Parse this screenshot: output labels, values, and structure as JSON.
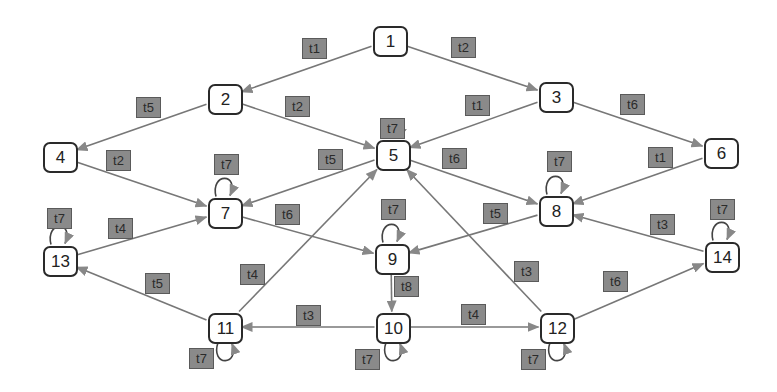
{
  "diagram": {
    "type": "state-transition-graph",
    "colors": {
      "edge": "#777777",
      "arrowhead": "#888888",
      "node_border": "#2a2a2a",
      "label_fill": "#8a8a8a",
      "label_text": "#2b2b2b"
    },
    "nodes": [
      {
        "id": "1",
        "label": "1",
        "x": 389,
        "y": 40
      },
      {
        "id": "2",
        "label": "2",
        "x": 224,
        "y": 98
      },
      {
        "id": "3",
        "label": "3",
        "x": 555,
        "y": 96
      },
      {
        "id": "4",
        "label": "4",
        "x": 59,
        "y": 156
      },
      {
        "id": "5",
        "label": "5",
        "x": 392,
        "y": 154
      },
      {
        "id": "6",
        "label": "6",
        "x": 720,
        "y": 152
      },
      {
        "id": "7",
        "label": "7",
        "x": 224,
        "y": 212
      },
      {
        "id": "8",
        "label": "8",
        "x": 555,
        "y": 210
      },
      {
        "id": "9",
        "label": "9",
        "x": 391,
        "y": 258
      },
      {
        "id": "10",
        "label": "10",
        "x": 392,
        "y": 327
      },
      {
        "id": "11",
        "label": "11",
        "x": 224,
        "y": 327
      },
      {
        "id": "12",
        "label": "12",
        "x": 556,
        "y": 327
      },
      {
        "id": "13",
        "label": "13",
        "x": 59,
        "y": 260
      },
      {
        "id": "14",
        "label": "14",
        "x": 721,
        "y": 256
      }
    ],
    "edges": [
      {
        "from": "1",
        "to": "2",
        "label": "t1",
        "lx": 302,
        "ly": 38
      },
      {
        "from": "1",
        "to": "3",
        "label": "t2",
        "lx": 451,
        "ly": 37
      },
      {
        "from": "2",
        "to": "4",
        "label": "t5",
        "lx": 136,
        "ly": 97
      },
      {
        "from": "2",
        "to": "5",
        "label": "t2",
        "lx": 285,
        "ly": 96
      },
      {
        "from": "3",
        "to": "5",
        "label": "t1",
        "lx": 465,
        "ly": 95
      },
      {
        "from": "3",
        "to": "6",
        "label": "t6",
        "lx": 620,
        "ly": 94
      },
      {
        "from": "4",
        "to": "7",
        "label": "t2",
        "lx": 106,
        "ly": 150
      },
      {
        "from": "5",
        "to": "7",
        "label": "t5",
        "lx": 318,
        "ly": 149
      },
      {
        "from": "5",
        "to": "8",
        "label": "t6",
        "lx": 442,
        "ly": 148
      },
      {
        "from": "6",
        "to": "8",
        "label": "t1",
        "lx": 648,
        "ly": 147
      },
      {
        "from": "7",
        "to": "9",
        "label": "t6",
        "lx": 275,
        "ly": 204
      },
      {
        "from": "8",
        "to": "9",
        "label": "t5",
        "lx": 483,
        "ly": 203
      },
      {
        "from": "13",
        "to": "7",
        "label": "t4",
        "lx": 108,
        "ly": 218
      },
      {
        "from": "11",
        "to": "5",
        "label": "t4",
        "lx": 240,
        "ly": 264
      },
      {
        "from": "12",
        "to": "5",
        "label": "t3",
        "lx": 514,
        "ly": 261
      },
      {
        "from": "14",
        "to": "8",
        "label": "t3",
        "lx": 650,
        "ly": 214
      },
      {
        "from": "12",
        "to": "14",
        "label": "t6",
        "lx": 603,
        "ly": 271
      },
      {
        "from": "9",
        "to": "10",
        "label": "t8",
        "lx": 394,
        "ly": 276
      },
      {
        "from": "10",
        "to": "11",
        "label": "t3",
        "lx": 296,
        "ly": 305
      },
      {
        "from": "10",
        "to": "12",
        "label": "t4",
        "lx": 461,
        "ly": 304
      },
      {
        "from": "11",
        "to": "13",
        "label": "t5",
        "lx": 145,
        "ly": 273
      }
    ],
    "self_loops": [
      {
        "node": "5",
        "label": "t7",
        "side": "top",
        "lx": 380,
        "ly": 118
      },
      {
        "node": "7",
        "label": "t7",
        "side": "top",
        "lx": 214,
        "ly": 154
      },
      {
        "node": "8",
        "label": "t7",
        "side": "top",
        "lx": 547,
        "ly": 151
      },
      {
        "node": "9",
        "label": "t7",
        "side": "top",
        "lx": 381,
        "ly": 199
      },
      {
        "node": "13",
        "label": "t7",
        "side": "top",
        "lx": 47,
        "ly": 208
      },
      {
        "node": "14",
        "label": "t7",
        "side": "top",
        "lx": 710,
        "ly": 199
      },
      {
        "node": "10",
        "label": "t7",
        "side": "bottom",
        "lx": 355,
        "ly": 349
      },
      {
        "node": "11",
        "label": "t7",
        "side": "bottom",
        "lx": 189,
        "ly": 348
      },
      {
        "node": "12",
        "label": "t7",
        "side": "bottom",
        "lx": 521,
        "ly": 349
      }
    ]
  }
}
